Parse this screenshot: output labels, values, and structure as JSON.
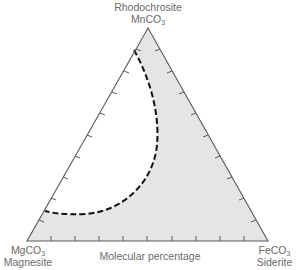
{
  "diagram": {
    "type": "ternary",
    "vertices": {
      "top": {
        "mineral": "Rhodochrosite",
        "formula_base": "MnCO",
        "formula_sub": "3"
      },
      "bottom_left": {
        "formula_base": "MgCO",
        "formula_sub": "3",
        "mineral": "Magnesite"
      },
      "bottom_right": {
        "formula_base": "FeCO",
        "formula_sub": "3",
        "mineral": "Siderite"
      }
    },
    "axis_label": "Molecular percentage",
    "tick_count_per_side": 9,
    "colors": {
      "fill": "#e3e5e7",
      "outline": "#5a5a5a",
      "dashed_boundary": "#111111",
      "label_text": "#6a6a6a"
    }
  }
}
